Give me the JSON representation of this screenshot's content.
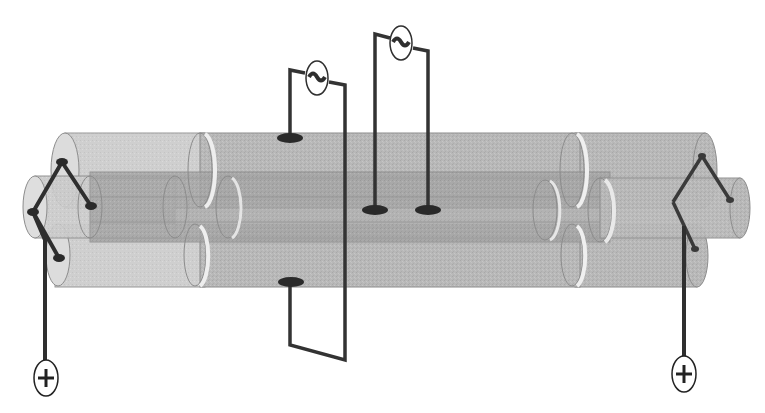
{
  "diagram": {
    "type": "schematic",
    "description": "Transparent concentric cylinder tubes arranged in a bundle with electrodes, two AC sources and two DC positive terminals",
    "colors": {
      "background": "#ffffff",
      "tube_fill": "#b9b9b9",
      "tube_fill_dark": "#a9a9a9",
      "tube_end_light": "#dcdcdc",
      "tube_ring_highlight": "#efefef",
      "tube_outline": "#8c8c8c",
      "wire": "#2f2f2f",
      "electrode": "#2a2a2a"
    },
    "components": {
      "ac_sources": [
        {
          "id": "ac-left",
          "symbol": "~",
          "x": 317,
          "y": 78
        },
        {
          "id": "ac-right",
          "symbol": "~",
          "x": 401,
          "y": 43
        }
      ],
      "dc_terminals": [
        {
          "id": "dc-left",
          "symbol": "+",
          "x": 46,
          "y": 378
        },
        {
          "id": "dc-right",
          "symbol": "+",
          "x": 684,
          "y": 374
        }
      ],
      "electrodes": [
        {
          "id": "top-left",
          "x": 290,
          "y": 137
        },
        {
          "id": "bottom-left",
          "x": 291,
          "y": 282
        },
        {
          "id": "center-a",
          "x": 375,
          "y": 210
        },
        {
          "id": "center-b",
          "x": 428,
          "y": 210
        }
      ]
    }
  }
}
